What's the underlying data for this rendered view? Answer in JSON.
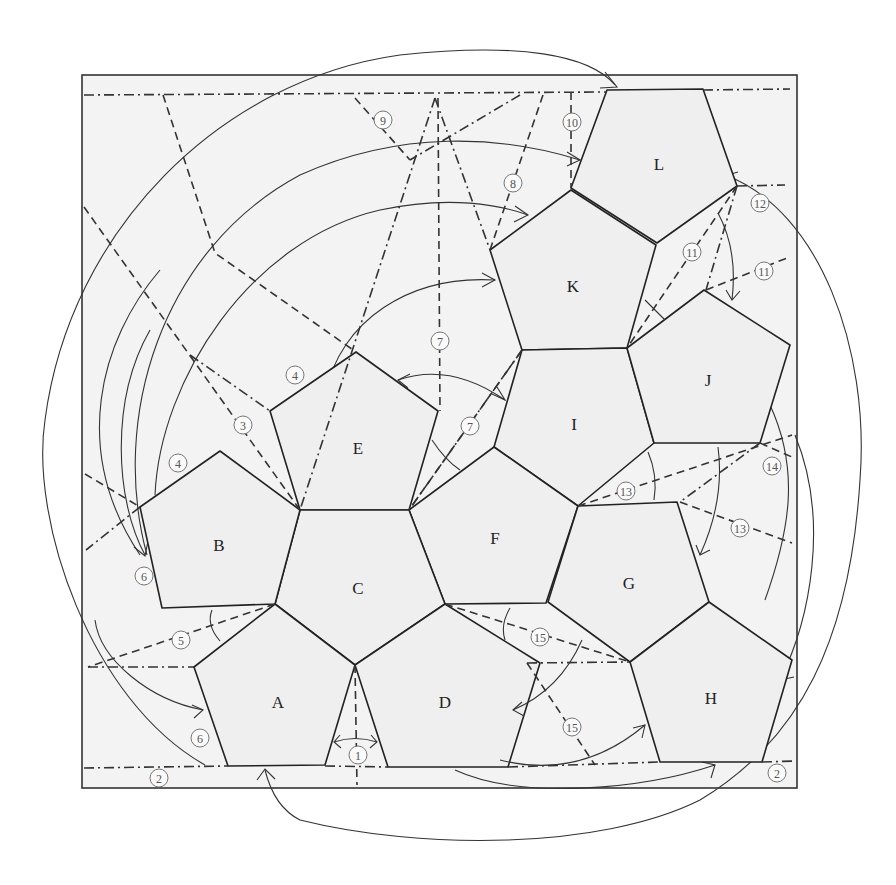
{
  "diagram": {
    "kind": "origami crease pattern",
    "faces": [
      {
        "id": "A",
        "label": "A"
      },
      {
        "id": "B",
        "label": "B"
      },
      {
        "id": "C",
        "label": "C"
      },
      {
        "id": "D",
        "label": "D"
      },
      {
        "id": "E",
        "label": "E"
      },
      {
        "id": "F",
        "label": "F"
      },
      {
        "id": "G",
        "label": "G"
      },
      {
        "id": "H",
        "label": "H"
      },
      {
        "id": "I",
        "label": "I"
      },
      {
        "id": "J",
        "label": "J"
      },
      {
        "id": "K",
        "label": "K"
      },
      {
        "id": "L",
        "label": "L"
      }
    ],
    "steps": [
      {
        "id": "s1",
        "label": "1"
      },
      {
        "id": "s2a",
        "label": "2"
      },
      {
        "id": "s2b",
        "label": "2"
      },
      {
        "id": "s3",
        "label": "3"
      },
      {
        "id": "s4a",
        "label": "4"
      },
      {
        "id": "s4b",
        "label": "4"
      },
      {
        "id": "s5",
        "label": "5"
      },
      {
        "id": "s6a",
        "label": "6"
      },
      {
        "id": "s6b",
        "label": "6"
      },
      {
        "id": "s7a",
        "label": "7"
      },
      {
        "id": "s7b",
        "label": "7"
      },
      {
        "id": "s8",
        "label": "8"
      },
      {
        "id": "s9",
        "label": "9"
      },
      {
        "id": "s10",
        "label": "10"
      },
      {
        "id": "s11a",
        "label": "11"
      },
      {
        "id": "s11b",
        "label": "11"
      },
      {
        "id": "s12",
        "label": "12"
      },
      {
        "id": "s13a",
        "label": "13"
      },
      {
        "id": "s13b",
        "label": "13"
      },
      {
        "id": "s14",
        "label": "14"
      },
      {
        "id": "s15a",
        "label": "15"
      },
      {
        "id": "s15b",
        "label": "15"
      }
    ],
    "line_styles": {
      "mountain_fold": "dash-dot",
      "valley_fold": "dashed",
      "fold_direction": "curved arrow"
    }
  }
}
